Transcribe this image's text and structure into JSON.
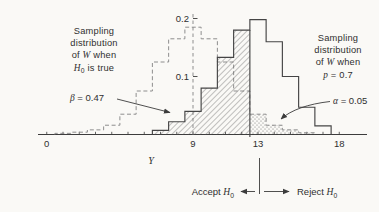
{
  "figure": {
    "background": "#faf9f6",
    "ink": "#3c3c3c",
    "dashed_ink": "#8e8e8e"
  },
  "chart_data": {
    "type": "histogram",
    "xlabel": "Y",
    "x_axis": {
      "range": [
        0,
        18
      ],
      "minor_tick_step": 1,
      "labeled_ticks": [
        0,
        9,
        13,
        18
      ]
    },
    "y_axis": {
      "position_x": 9,
      "ticks": [
        0.1,
        0.2
      ],
      "tick_labels": [
        "0.1",
        "0.2"
      ],
      "style": "dashed",
      "range": [
        0,
        0.21
      ]
    },
    "series": [
      {
        "name": "Sampling distribution of W when H0 is true",
        "style": "dashed",
        "bin_width": 1,
        "bin_centers": [
          1,
          2,
          3,
          4,
          5,
          6,
          7,
          8,
          9,
          10,
          11,
          12,
          13,
          14,
          15,
          16
        ],
        "heights": [
          0.002,
          0.004,
          0.008,
          0.016,
          0.035,
          0.075,
          0.125,
          0.165,
          0.185,
          0.165,
          0.125,
          0.075,
          0.035,
          0.016,
          0.008,
          0.003
        ]
      },
      {
        "name": "Sampling distribution of W when p = 0.7",
        "style": "solid",
        "bin_width": 1,
        "bin_centers": [
          7,
          8,
          9,
          10,
          11,
          12,
          13,
          14,
          15,
          16,
          17
        ],
        "heights": [
          0.007,
          0.022,
          0.04,
          0.08,
          0.133,
          0.18,
          0.198,
          0.16,
          0.1,
          0.047,
          0.015
        ]
      }
    ],
    "regions": [
      {
        "name": "beta-accept-region",
        "series": 1,
        "from": 6.5,
        "to": 12.5,
        "fill": "hatched",
        "label": "β = 0.47",
        "area": 0.47
      },
      {
        "name": "alpha-reject-region",
        "series": 0,
        "from": 12.5,
        "to": 16.5,
        "fill": "stippled",
        "label": "α = 0.05",
        "area": 0.05
      }
    ],
    "decision_boundary": 13
  },
  "annotations": {
    "h0_annotation": {
      "line1": "Sampling",
      "line2": "distribution",
      "line3_pre": "of ",
      "line3_var": "W",
      "line3_post": " when",
      "line4_var": "H",
      "line4_sub": "0",
      "line4_post": " is true"
    },
    "rho_annotation": {
      "line1": "Sampling",
      "line2": "distribution",
      "line3_pre": "of ",
      "line3_var": "W",
      "line3_post": " when",
      "line4_var": "p",
      "line4_post": " = 0.7"
    },
    "beta_label": {
      "var": "β",
      "rest": " = 0.47"
    },
    "alpha_label": {
      "var": "α",
      "rest": " = 0.05"
    },
    "x_axis_label": "Y"
  },
  "decision_labels": {
    "accept_pre": "Accept ",
    "accept_var": "H",
    "accept_sub": "0",
    "reject_pre": "Reject ",
    "reject_var": "H",
    "reject_sub": "0"
  }
}
